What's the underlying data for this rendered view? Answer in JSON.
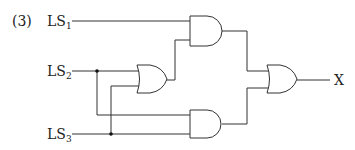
{
  "problem_number": "(3)",
  "inputs": [
    {
      "name": "LS",
      "sub": "1"
    },
    {
      "name": "LS",
      "sub": "2"
    },
    {
      "name": "LS",
      "sub": "3"
    }
  ],
  "output": {
    "label": "X"
  },
  "gates": [
    {
      "id": "and1",
      "type": "AND",
      "inputs": [
        "LS1",
        "or1"
      ]
    },
    {
      "id": "or1",
      "type": "OR",
      "inputs": [
        "LS2",
        "LS3"
      ]
    },
    {
      "id": "and2",
      "type": "AND",
      "inputs": [
        "LS2",
        "LS3"
      ]
    },
    {
      "id": "or2",
      "type": "OR",
      "inputs": [
        "and1",
        "and2"
      ],
      "output": "X"
    }
  ]
}
